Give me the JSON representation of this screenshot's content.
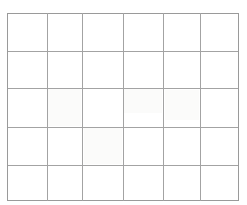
{
  "figure": {
    "kind": "blank-grid-table",
    "background_color": "#ffffff",
    "line_color": "#a3a3a3",
    "edge_line_color": "#9a9a9a",
    "line_width_px": 1.3,
    "columns": 6,
    "rows": 5,
    "cell_text": ""
  },
  "grid_geometry": {
    "canvas_width": 247,
    "canvas_height": 205,
    "vertical_line_x": [
      7,
      47,
      82,
      123,
      163,
      200,
      238
    ],
    "horizontal_line_y": [
      13,
      51,
      88,
      127,
      165,
      200
    ],
    "column_widths": [
      40,
      35,
      41,
      40,
      37,
      38
    ],
    "row_heights": [
      38,
      37,
      39,
      38,
      35
    ]
  },
  "paper_tints": [
    {
      "x": 48,
      "y": 89,
      "w": 33,
      "h": 37
    },
    {
      "x": 84,
      "y": 128,
      "w": 38,
      "h": 36
    },
    {
      "x": 124,
      "y": 89,
      "w": 38,
      "h": 24
    },
    {
      "x": 165,
      "y": 90,
      "w": 34,
      "h": 30
    }
  ],
  "chart_data": {
    "type": "table",
    "title": "",
    "columns": 6,
    "rows": 5,
    "headers": [
      "",
      "",
      "",
      "",
      "",
      ""
    ],
    "values": [
      [
        "",
        "",
        "",
        "",
        "",
        ""
      ],
      [
        "",
        "",
        "",
        "",
        "",
        ""
      ],
      [
        "",
        "",
        "",
        "",
        "",
        ""
      ],
      [
        "",
        "",
        "",
        "",
        "",
        ""
      ],
      [
        "",
        "",
        "",
        "",
        "",
        ""
      ]
    ],
    "grid": true,
    "legend": "none",
    "annotations": []
  }
}
